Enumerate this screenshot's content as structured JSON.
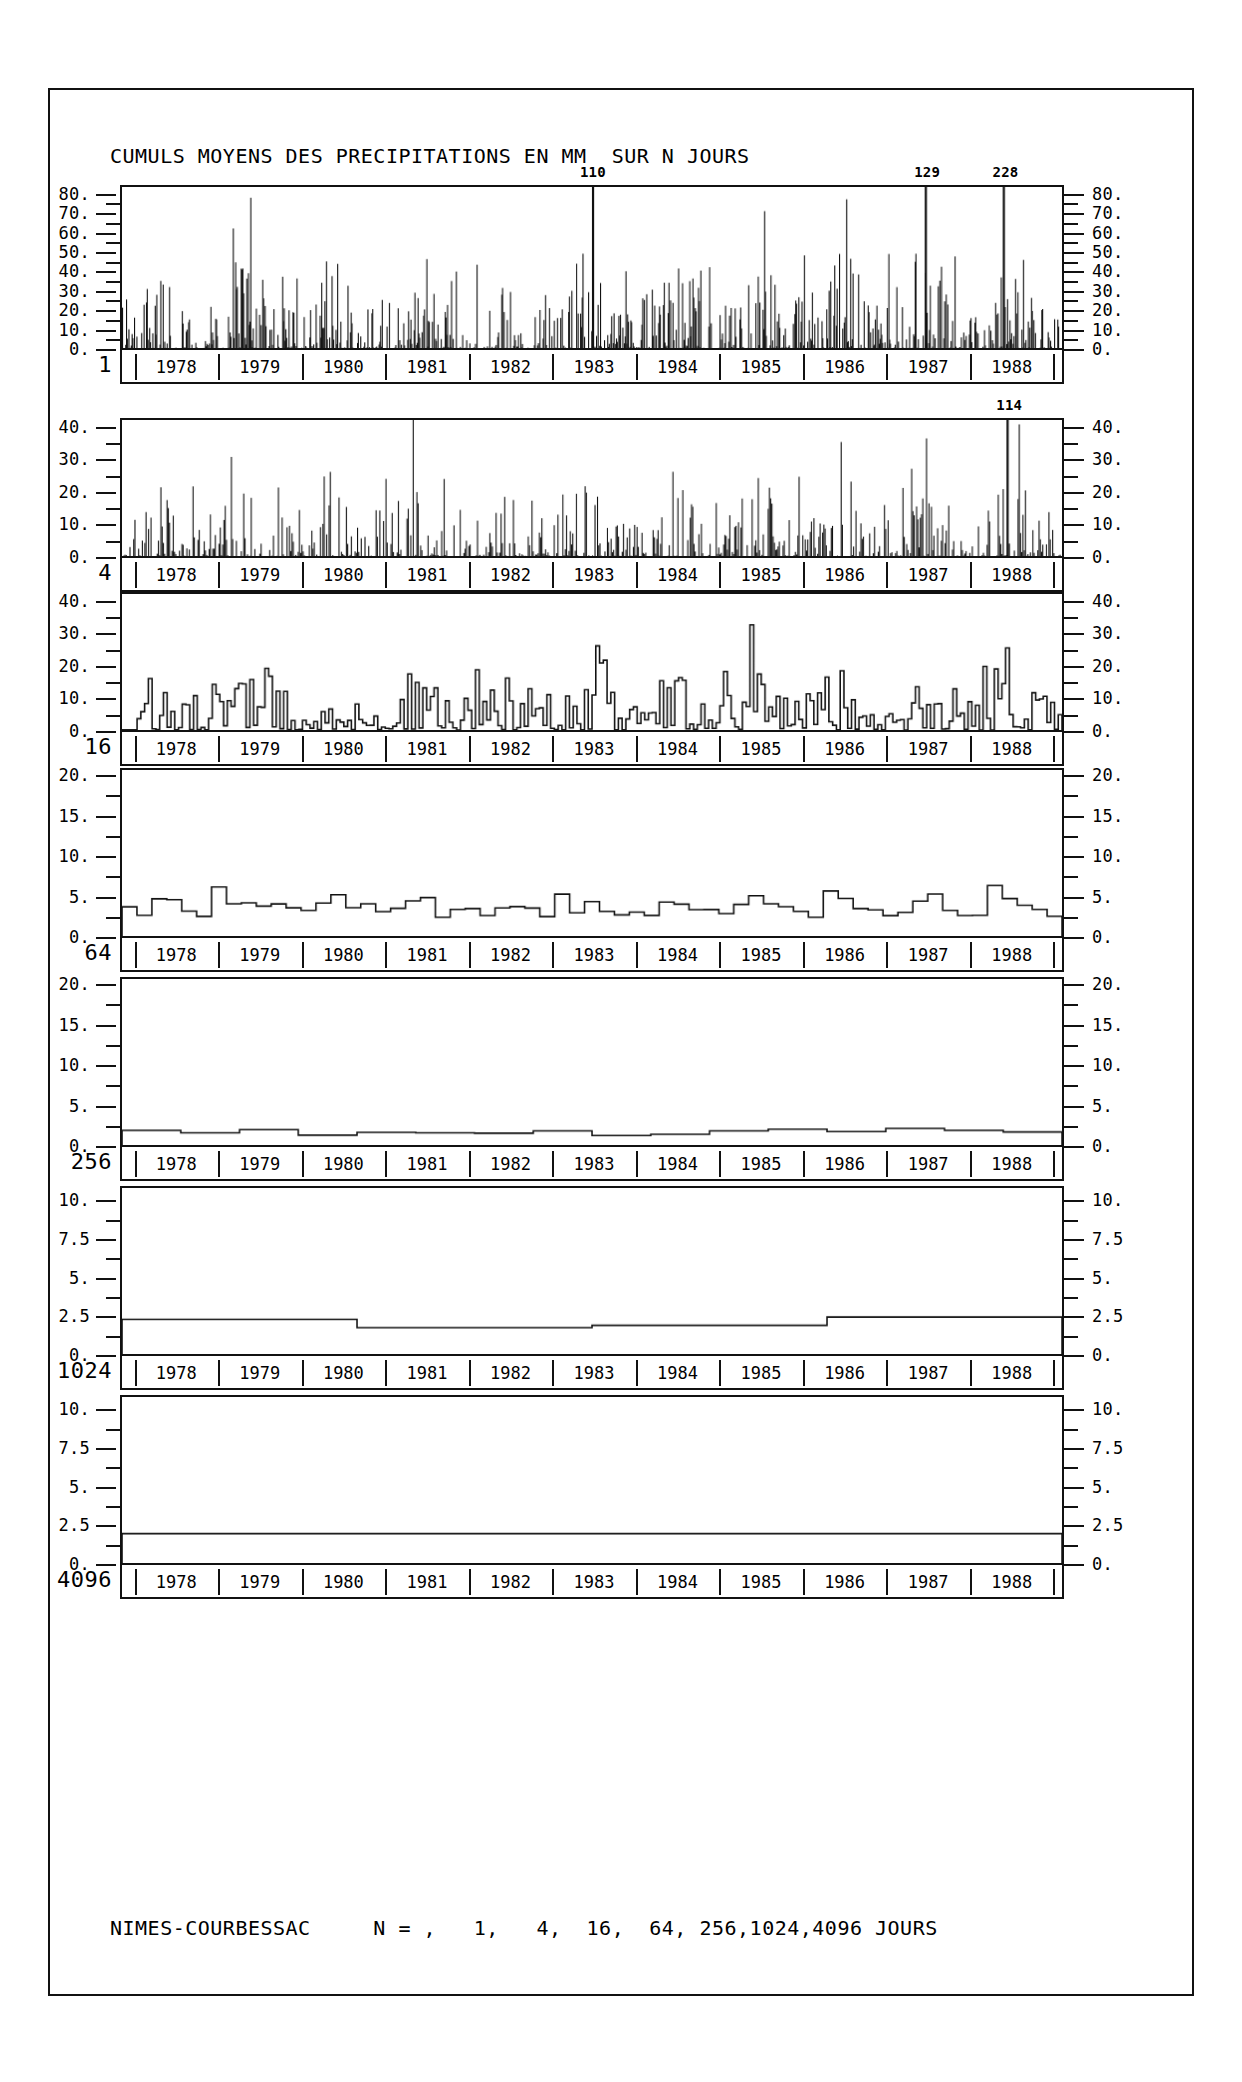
{
  "chart_data": {
    "type": "bar",
    "title": "CUMULS MOYENS DES PRECIPITATIONS EN MM  SUR N JOURS",
    "caption": "NIMES-COURBESSAC     N = ,   1,   4,  16,  64, 256,1024,4096 JOURS",
    "station": "NIMES-COURBESSAC",
    "xlabel": "",
    "ylabel": "",
    "units": "mm",
    "grid": false,
    "legend": "none",
    "years": [
      "1978",
      "1979",
      "1980",
      "1981",
      "1982",
      "1983",
      "1984",
      "1985",
      "1986",
      "1987",
      "1988"
    ],
    "x_range": [
      "1978",
      "1989"
    ],
    "panels": [
      {
        "n_label": "1",
        "n_days": 1,
        "ylim": [
          0,
          85
        ],
        "yticks": [
          0,
          10,
          20,
          30,
          40,
          50,
          60,
          70,
          80
        ],
        "ytick_labels": [
          "0.",
          "10.",
          "20.",
          "30.",
          "40.",
          "50.",
          "60.",
          "70.",
          "80."
        ],
        "annotations": [
          {
            "label": "110",
            "x_frac": 0.501,
            "value": 110
          },
          {
            "label": "129",
            "x_frac": 0.855,
            "value": 129
          },
          {
            "label": "228",
            "x_frac": 0.938,
            "value": 228
          }
        ],
        "seed": 11,
        "density": 0.62,
        "spike_scale": 88,
        "style": "spikes"
      },
      {
        "n_label": "4",
        "n_days": 4,
        "ylim": [
          0,
          43
        ],
        "yticks": [
          0,
          10,
          20,
          30,
          40
        ],
        "ytick_labels": [
          "0.",
          "10.",
          "20.",
          "30.",
          "40."
        ],
        "annotations": [
          {
            "label": "114",
            "x_frac": 0.942,
            "value": 114
          }
        ],
        "seed": 29,
        "density": 0.72,
        "spike_scale": 44,
        "style": "spikes"
      },
      {
        "n_label": "16",
        "n_days": 16,
        "ylim": [
          0,
          43
        ],
        "yticks": [
          0,
          10,
          20,
          30,
          40
        ],
        "ytick_labels": [
          "0.",
          "10.",
          "20.",
          "30.",
          "40."
        ],
        "annotations": [],
        "seed": 53,
        "density": 0.9,
        "spike_scale": 13,
        "style": "steps-fine"
      },
      {
        "n_label": "64",
        "n_days": 64,
        "ylim": [
          0,
          21
        ],
        "yticks": [
          0,
          5,
          10,
          15,
          20
        ],
        "ytick_labels": [
          "0.",
          "5.",
          "10.",
          "15.",
          "20."
        ],
        "annotations": [],
        "seed": 71,
        "density": 1.0,
        "spike_scale": 6.5,
        "style": "steps-coarse",
        "steps": 63
      },
      {
        "n_label": "256",
        "n_days": 256,
        "ylim": [
          0,
          21
        ],
        "yticks": [
          0,
          5,
          10,
          15,
          20
        ],
        "ytick_labels": [
          "0.",
          "5.",
          "10.",
          "15.",
          "20."
        ],
        "annotations": [],
        "seed": 97,
        "density": 1.0,
        "spike_scale": 2.0,
        "style": "steps-wide",
        "steps": 16,
        "step_values": [
          1.85,
          1.55,
          1.95,
          1.25,
          1.6,
          1.55,
          1.5,
          1.8,
          1.2,
          1.35,
          1.8,
          2.0,
          1.7,
          2.1,
          1.85,
          1.65
        ]
      },
      {
        "n_label": "1024",
        "n_days": 1024,
        "ylim": [
          0,
          11
        ],
        "yticks": [
          0,
          2.5,
          5,
          7.5,
          10
        ],
        "ytick_labels": [
          "0.",
          "2.5",
          "5.",
          "7.5",
          "10."
        ],
        "annotations": [],
        "seed": 131,
        "style": "steps-verywide",
        "steps": 4,
        "step_values": [
          2.3,
          1.75,
          1.9,
          2.45
        ]
      },
      {
        "n_label": "4096",
        "n_days": 4096,
        "ylim": [
          0,
          11
        ],
        "yticks": [
          0,
          2.5,
          5,
          7.5,
          10
        ],
        "ytick_labels": [
          "0.",
          "2.5",
          "5.",
          "7.5",
          "10."
        ],
        "annotations": [],
        "seed": 173,
        "style": "flat",
        "steps": 1,
        "step_values": [
          1.95
        ]
      }
    ]
  }
}
